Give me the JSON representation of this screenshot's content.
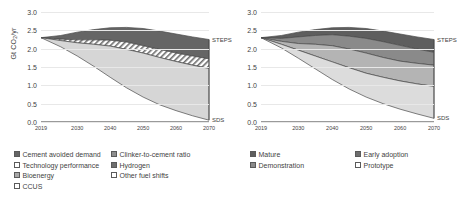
{
  "chart_data": [
    {
      "type": "area",
      "id": "left-panel",
      "title": "",
      "xlabel": "",
      "ylabel": "Gt CO2/yr",
      "ylabel_display": "Gt CO₂/yr",
      "ylim": [
        0.0,
        3.0
      ],
      "ytick_labels": [
        "0.0",
        "0.5",
        "1.0",
        "1.5",
        "2.0",
        "2.5",
        "3.0"
      ],
      "ytick_values": [
        0.0,
        0.5,
        1.0,
        1.5,
        2.0,
        2.5,
        3.0
      ],
      "xlim": [
        2019,
        2070
      ],
      "xtick_labels": [
        "2019",
        "2030",
        "2040",
        "2050",
        "2060",
        "2070"
      ],
      "xtick_values": [
        2019,
        2030,
        2040,
        2050,
        2060,
        2070
      ],
      "grid": true,
      "legend_position": "below",
      "annotations": [
        {
          "text": "STEPS",
          "x": 2070,
          "y": 2.25
        },
        {
          "text": "SDS",
          "x": 2070,
          "y": 0.05
        }
      ],
      "x": [
        2019,
        2025,
        2030,
        2035,
        2040,
        2045,
        2050,
        2055,
        2060,
        2065,
        2070
      ],
      "boundaries": {
        "steps": [
          2.3,
          2.36,
          2.45,
          2.52,
          2.57,
          2.58,
          2.55,
          2.48,
          2.4,
          2.32,
          2.25
        ],
        "after_dark_band": [
          2.3,
          2.26,
          2.24,
          2.24,
          2.23,
          2.18,
          2.08,
          1.98,
          1.88,
          1.8,
          1.72
        ],
        "after_hatched_band": [
          2.3,
          2.22,
          2.16,
          2.12,
          2.07,
          1.98,
          1.88,
          1.76,
          1.65,
          1.55,
          1.46
        ],
        "sds": [
          2.3,
          2.05,
          1.8,
          1.52,
          1.22,
          0.93,
          0.68,
          0.47,
          0.31,
          0.17,
          0.05
        ]
      },
      "bands": [
        {
          "name": "dark-upper-band",
          "fill": "#656565",
          "pattern": "solid"
        },
        {
          "name": "hatched-band",
          "fill": "#ffffff",
          "pattern": "diagonal-hatch"
        },
        {
          "name": "light-lower-band",
          "fill": "#d6d6d6",
          "pattern": "solid"
        }
      ]
    },
    {
      "type": "area",
      "id": "right-panel",
      "title": "",
      "xlabel": "",
      "ylabel": "",
      "ylim": [
        0.0,
        3.0
      ],
      "ytick_labels": [
        "0.0",
        "0.5",
        "1.0",
        "1.5",
        "2.0",
        "2.5",
        "3.0"
      ],
      "ytick_values": [
        0.0,
        0.5,
        1.0,
        1.5,
        2.0,
        2.5,
        3.0
      ],
      "xlim": [
        2019,
        2070
      ],
      "xtick_labels": [
        "2019",
        "2030",
        "2040",
        "2050",
        "2060",
        "2070"
      ],
      "xtick_values": [
        2019,
        2030,
        2040,
        2050,
        2060,
        2070
      ],
      "grid": true,
      "legend_position": "below",
      "annotations": [
        {
          "text": "STEPS",
          "x": 2070,
          "y": 2.25
        },
        {
          "text": "SDS",
          "x": 2070,
          "y": 0.1
        }
      ],
      "x": [
        2019,
        2025,
        2030,
        2035,
        2040,
        2045,
        2050,
        2055,
        2060,
        2065,
        2070
      ],
      "boundaries": {
        "steps": [
          2.3,
          2.36,
          2.45,
          2.52,
          2.57,
          2.58,
          2.55,
          2.48,
          2.4,
          2.32,
          2.25
        ],
        "after_mature": [
          2.3,
          2.28,
          2.32,
          2.36,
          2.38,
          2.34,
          2.28,
          2.19,
          2.09,
          1.99,
          1.9
        ],
        "after_early_adoption": [
          2.3,
          2.2,
          2.14,
          2.12,
          2.08,
          1.99,
          1.88,
          1.76,
          1.66,
          1.6,
          1.55
        ],
        "after_demonstration": [
          2.3,
          2.12,
          1.96,
          1.8,
          1.64,
          1.48,
          1.33,
          1.22,
          1.12,
          1.04,
          0.97
        ],
        "sds": [
          2.3,
          2.02,
          1.74,
          1.45,
          1.16,
          0.9,
          0.68,
          0.5,
          0.35,
          0.22,
          0.1
        ]
      },
      "bands": [
        {
          "name": "mature-band",
          "fill": "#5e5e5e",
          "pattern": "solid"
        },
        {
          "name": "early-adoption-band",
          "fill": "#8a8a8a",
          "pattern": "solid"
        },
        {
          "name": "demonstration-band",
          "fill": "#b4b4b4",
          "pattern": "solid"
        },
        {
          "name": "prototype-band",
          "fill": "#dcdcdc",
          "pattern": "solid"
        }
      ]
    }
  ],
  "legend": {
    "columns": [
      {
        "id": "col-1",
        "items": [
          {
            "label": "Cement avoided demand",
            "color": "#656565",
            "pattern": "solid"
          },
          {
            "label": "Technology performance",
            "color": "#ffffff",
            "pattern": "solid"
          },
          {
            "label": "Bioenergy",
            "color": "#a8a8a8",
            "pattern": "solid"
          },
          {
            "label": "CCUS",
            "color": "#ffffff",
            "pattern": "solid"
          }
        ]
      },
      {
        "id": "col-2",
        "items": [
          {
            "label": "Clinker-to-cement ratio",
            "color": "#8e8e8e",
            "pattern": "solid"
          },
          {
            "label": "Hydrogen",
            "color": "#6e6e6e",
            "pattern": "solid"
          },
          {
            "label": "Other fuel shifts",
            "color": "#ffffff",
            "pattern": "solid"
          }
        ]
      },
      {
        "id": "col-3",
        "items": [
          {
            "label": "Mature",
            "color": "#5e5e5e",
            "pattern": "solid"
          },
          {
            "label": "Demonstration",
            "color": "#8a8a8a",
            "pattern": "solid"
          }
        ]
      },
      {
        "id": "col-4",
        "items": [
          {
            "label": "Early adoption",
            "color": "#6e6e6e",
            "pattern": "solid"
          },
          {
            "label": "Prototype",
            "color": "#ffffff",
            "pattern": "solid"
          }
        ]
      }
    ]
  }
}
